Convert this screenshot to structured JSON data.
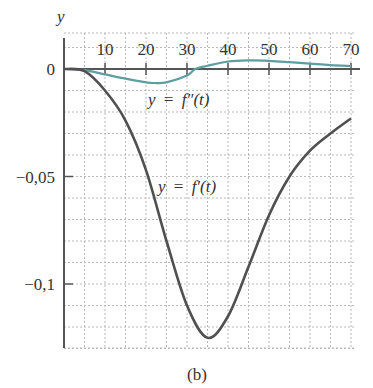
{
  "chart_data": {
    "type": "line",
    "title": "",
    "caption": "(b)",
    "xlabel": "",
    "ylabel": "y",
    "xlim": [
      0,
      72
    ],
    "ylim": [
      -0.13,
      0.015
    ],
    "grid": true,
    "x_ticks": [
      10,
      20,
      30,
      40,
      50,
      60,
      70
    ],
    "x_tick_labels": [
      "10",
      "20",
      "30",
      "40",
      "50",
      "60",
      "70"
    ],
    "y_ticks": [
      0,
      -0.05,
      -0.1
    ],
    "y_tick_labels": [
      "0",
      "−0,05",
      "−0,1"
    ],
    "series": [
      {
        "name": "y = f″(t)",
        "color": "#5d9ea0",
        "x": [
          0,
          5,
          10,
          15,
          20,
          22,
          25,
          30,
          32,
          35,
          40,
          45,
          50,
          55,
          60,
          65,
          70
        ],
        "values": [
          0,
          -0.0005,
          -0.0025,
          -0.0045,
          -0.0062,
          -0.0065,
          -0.0062,
          -0.003,
          0,
          0.0015,
          0.0035,
          0.004,
          0.0038,
          0.0032,
          0.0025,
          0.0018,
          0.0014
        ]
      },
      {
        "name": "y = f′(t)",
        "color": "#505050",
        "x": [
          0,
          5,
          10,
          15,
          20,
          25,
          30,
          35,
          40,
          45,
          50,
          55,
          60,
          65,
          70
        ],
        "values": [
          0,
          -0.001,
          -0.01,
          -0.024,
          -0.047,
          -0.08,
          -0.11,
          -0.125,
          -0.115,
          -0.092,
          -0.068,
          -0.05,
          -0.038,
          -0.03,
          -0.023
        ]
      }
    ],
    "annotations": [
      {
        "text": "y = f″(t)",
        "x": 21,
        "y": -0.012
      },
      {
        "text": "y = f′(t)",
        "x": 23,
        "y": -0.055
      }
    ]
  },
  "labels": {
    "y_axis": "y",
    "caption": "(b)",
    "fpp_label_y": "y",
    "fpp_label_eq": "=",
    "fpp_label_f": "f″(t)",
    "fp_label_y": "y",
    "fp_label_eq": "=",
    "fp_label_f": "f′(t)"
  }
}
